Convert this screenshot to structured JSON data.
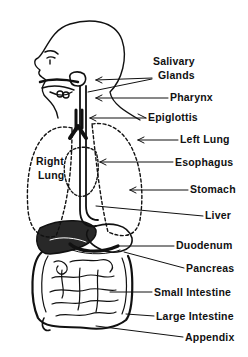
{
  "diagram": {
    "labels": [
      {
        "id": "salivary-1",
        "text": "Salivary",
        "x": 153,
        "y": 60
      },
      {
        "id": "salivary-2",
        "text": "Glands",
        "x": 158,
        "y": 74
      },
      {
        "id": "pharynx",
        "text": "Pharynx",
        "x": 170,
        "y": 93
      },
      {
        "id": "epiglottis",
        "text": "Epiglottis",
        "x": 148,
        "y": 112
      },
      {
        "id": "left-lung",
        "text": "Left Lung",
        "x": 180,
        "y": 134
      },
      {
        "id": "right-lung-1",
        "text": "Right",
        "x": 36,
        "y": 155
      },
      {
        "id": "right-lung-2",
        "text": "Lung",
        "x": 38,
        "y": 170
      },
      {
        "id": "esophagus",
        "text": "Esophagus",
        "x": 175,
        "y": 157
      },
      {
        "id": "stomach",
        "text": "Stomach",
        "x": 190,
        "y": 184
      },
      {
        "id": "liver",
        "text": "Liver",
        "x": 205,
        "y": 211
      },
      {
        "id": "duodenum",
        "text": "Duodenum",
        "x": 176,
        "y": 240
      },
      {
        "id": "pancreas",
        "text": "Pancreas",
        "x": 186,
        "y": 263
      },
      {
        "id": "small-intestine",
        "text": "Small Intestine",
        "x": 154,
        "y": 287
      },
      {
        "id": "large-intestine",
        "text": "Large Intestine",
        "x": 156,
        "y": 311
      },
      {
        "id": "appendix",
        "text": "Appendix",
        "x": 185,
        "y": 332
      }
    ],
    "colors": {
      "ink": "#111111",
      "background": "#ffffff"
    }
  }
}
